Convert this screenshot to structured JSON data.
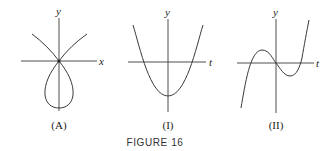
{
  "figure": {
    "caption": "FIGURE 16",
    "panels": [
      {
        "id": "A",
        "label": "(A)",
        "x_axis_label": "x",
        "y_axis_label": "y",
        "description": "Parametric curve in the xy-plane with a teardrop loop below the origin and two branches rising up-left and up-right through the origin"
      },
      {
        "id": "I",
        "label": "(I)",
        "x_axis_label": "t",
        "y_axis_label": "y",
        "description": "Upward parabola with vertex below the t-axis on the y-axis, crossing the t-axis at two symmetric points"
      },
      {
        "id": "II",
        "label": "(II)",
        "x_axis_label": "t",
        "y_axis_label": "y",
        "description": "Cubic curve through the origin with a local maximum left of the y-axis and a local minimum right of it, crossing the t-axis three times"
      }
    ]
  }
}
